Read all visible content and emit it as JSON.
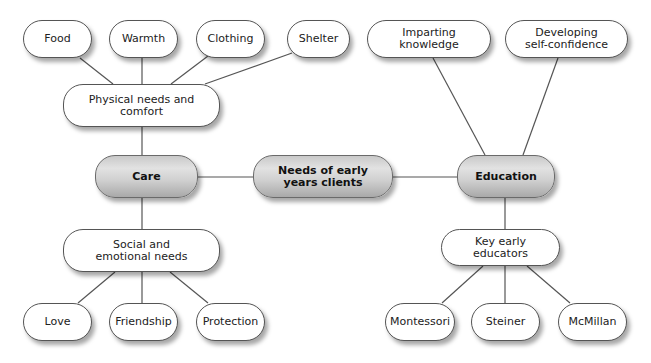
{
  "diagram": {
    "title": "Needs of early years clients",
    "colors": {
      "node_fill": "#ffffff",
      "hub_fill": "#cfcfcf",
      "border": "#555555",
      "line": "#555555"
    },
    "center": {
      "label": "Needs of early years clients"
    },
    "care": {
      "label": "Care",
      "physical": {
        "label": "Physical needs and comfort",
        "children": [
          "Food",
          "Warmth",
          "Clothing",
          "Shelter"
        ]
      },
      "social": {
        "label": "Social and emotional needs",
        "children": [
          "Love",
          "Friendship",
          "Protection"
        ]
      }
    },
    "education": {
      "label": "Education",
      "aims": [
        "Imparting knowledge",
        "Developing self-confidence"
      ],
      "educators": {
        "label": "Key early educators",
        "children": [
          "Montessori",
          "Steiner",
          "McMillan"
        ]
      }
    }
  }
}
